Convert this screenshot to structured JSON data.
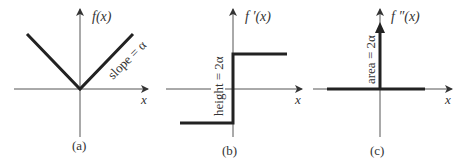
{
  "figure": {
    "colors": {
      "axis": "#555555",
      "curve": "#222222",
      "text": "#333333"
    },
    "panels": [
      {
        "id": "a",
        "caption": "(a)",
        "y_label": "f(x)",
        "x_label": "x",
        "annotation": "slope = α",
        "description": "V-shaped absolute value function with vertex at origin"
      },
      {
        "id": "b",
        "caption": "(b)",
        "y_label": "f ′(x)",
        "x_label": "x",
        "annotation": "height = 2α",
        "description": "Step function jumping from -α to +α at origin"
      },
      {
        "id": "c",
        "caption": "(c)",
        "y_label": "f ″(x)",
        "x_label": "x",
        "annotation": "area = 2α",
        "description": "Zero everywhere with a delta spike at origin"
      }
    ]
  }
}
